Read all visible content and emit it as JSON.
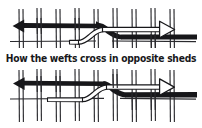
{
  "figure": {
    "title": "How the wefts cross in opposite sheds",
    "caption": "How the wefts cross in opposite sheds",
    "kind": "weaving-diagram",
    "background_color": "#ffffff",
    "ink_color": "#17171a",
    "outline_fill_color": "#ffffff",
    "panels": [
      {
        "id": "top-panel",
        "label": "upper shed diagram",
        "warp_pair_count": 9,
        "weft_arrows": [
          {
            "id": "top-black-arrow",
            "style": "solid-black",
            "direction": "left",
            "arrowhead": "filled-triangle-left",
            "label": "black weft travelling left"
          },
          {
            "id": "top-white-arrow",
            "style": "outline-white",
            "direction": "right",
            "arrowhead": "open-triangle-right",
            "label": "white weft travelling right"
          }
        ],
        "crossing_point": "center"
      },
      {
        "id": "bottom-panel",
        "label": "lower shed diagram",
        "warp_pair_count": 9,
        "weft_arrows": [
          {
            "id": "bottom-black-arrow",
            "style": "solid-black",
            "direction": "left",
            "arrowhead": "filled-triangle-left",
            "label": "black weft travelling left"
          },
          {
            "id": "bottom-white-arrow",
            "style": "outline-white",
            "direction": "right",
            "arrowhead": "open-triangle-right",
            "label": "white weft travelling right"
          }
        ],
        "crossing_point": "center"
      }
    ]
  }
}
